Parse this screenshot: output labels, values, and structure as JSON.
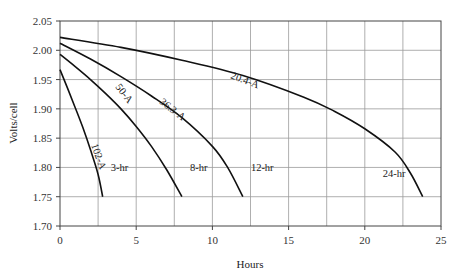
{
  "chart_data": {
    "type": "line",
    "title": "",
    "xlabel": "Hours",
    "ylabel": "Volts/cell",
    "xlim": [
      0,
      25
    ],
    "ylim": [
      1.7,
      2.05
    ],
    "x_ticks": [
      "0",
      "5",
      "10",
      "15",
      "20",
      "25"
    ],
    "y_ticks": [
      "1.70",
      "1.75",
      "1.80",
      "1.85",
      "1.90",
      "1.95",
      "2.00",
      "2.05"
    ],
    "grid": true,
    "grid_x_step": 2.5,
    "grid_y_step": 0.05,
    "legend": "none (inline curve labels)",
    "series": [
      {
        "name": "102-A",
        "end_label": "3-hr",
        "x": [
          0,
          0.5,
          1.0,
          1.5,
          2.0,
          2.5,
          2.8
        ],
        "y": [
          1.967,
          1.935,
          1.902,
          1.868,
          1.83,
          1.788,
          1.75
        ]
      },
      {
        "name": "50-A",
        "end_label": "8-hr",
        "x": [
          0,
          1,
          2,
          3,
          4,
          5,
          6,
          7,
          8
        ],
        "y": [
          1.993,
          1.972,
          1.95,
          1.926,
          1.9,
          1.87,
          1.836,
          1.796,
          1.75
        ]
      },
      {
        "name": "36.3-A",
        "end_label": "12-hr",
        "x": [
          0,
          2,
          4,
          6,
          8,
          10,
          11,
          12
        ],
        "y": [
          2.012,
          1.985,
          1.955,
          1.922,
          1.885,
          1.836,
          1.8,
          1.75
        ]
      },
      {
        "name": "20.4-A",
        "end_label": "24-hr",
        "x": [
          0,
          4,
          8,
          12,
          16,
          18,
          20,
          22,
          23,
          23.8
        ],
        "y": [
          2.022,
          2.005,
          1.983,
          1.957,
          1.92,
          1.896,
          1.866,
          1.826,
          1.79,
          1.75
        ]
      }
    ]
  }
}
